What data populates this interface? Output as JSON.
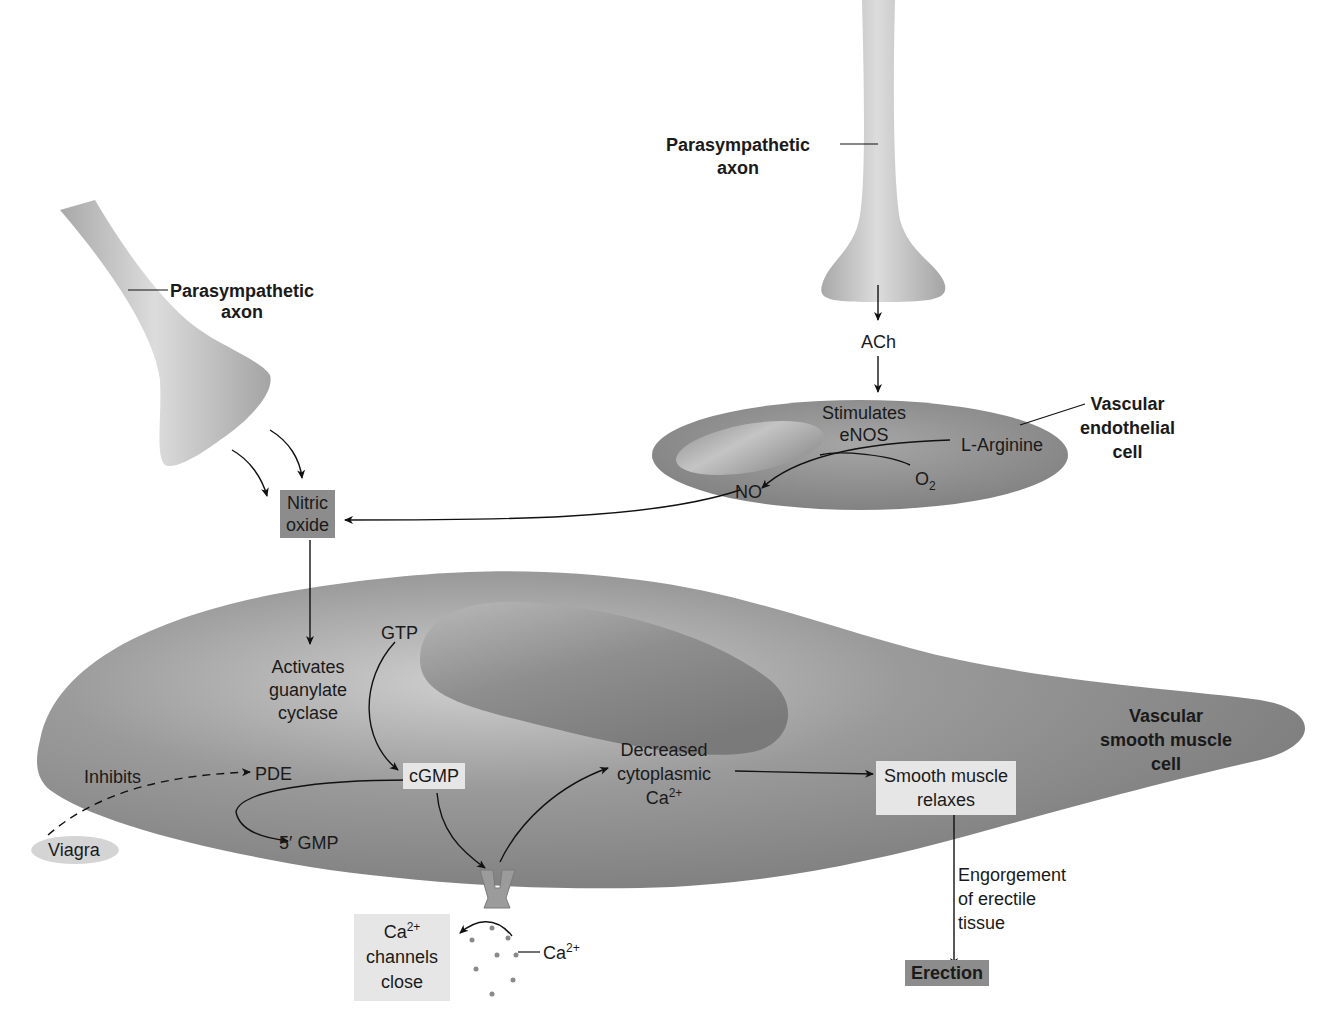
{
  "diagram": {
    "structures": {
      "axon_left": "Parasympathetic axon",
      "axon_right": "Parasympathetic axon",
      "endothelial_cell": [
        "Vascular",
        "endothelial",
        "cell"
      ],
      "smooth_muscle_cell": [
        "Vascular",
        "smooth muscle",
        "cell"
      ]
    },
    "labels": {
      "axon_left_1": "Parasympathetic",
      "axon_left_2": "axon",
      "axon_right_1": "Parasympathetic",
      "axon_right_2": "axon",
      "ach": "ACh",
      "stimulates": "Stimulates",
      "enos": "eNOS",
      "l_arginine": "L-Arginine",
      "o2_base": "O",
      "o2_sub": "2",
      "no": "NO",
      "endo_1": "Vascular",
      "endo_2": "endothelial",
      "endo_3": "cell",
      "nitric_1": "Nitric",
      "nitric_2": "oxide",
      "activates_1": "Activates",
      "activates_2": "guanylate",
      "activates_3": "cyclase",
      "gtp": "GTP",
      "cgmp": "cGMP",
      "pde": "PDE",
      "inhibits": "Inhibits",
      "viagra": "Viagra",
      "gmp5": "5′ GMP",
      "decreased_1": "Decreased",
      "decreased_2": "cytoplasmic",
      "decreased_3_base": "Ca",
      "decreased_3_sup": "2+",
      "relaxes_1": "Smooth muscle",
      "relaxes_2": "relaxes",
      "vsm_1": "Vascular",
      "vsm_2": "smooth muscle",
      "vsm_3": "cell",
      "channels_1_base": "Ca",
      "channels_1_sup": "2+",
      "channels_2": "channels",
      "channels_3": "close",
      "ca_ion_base": "Ca",
      "ca_ion_sup": "2+",
      "engorgement_1": "Engorgement",
      "engorgement_2": "of erectile",
      "engorgement_3": "tissue",
      "erection": "Erection"
    },
    "edges": [
      {
        "from": "Parasympathetic axon (left)",
        "to": "Nitric oxide",
        "style": "solid"
      },
      {
        "from": "Parasympathetic axon (right)",
        "to": "ACh",
        "style": "solid"
      },
      {
        "from": "ACh",
        "to": "Vascular endothelial cell",
        "style": "solid"
      },
      {
        "from": "L-Arginine + O2",
        "to": "NO",
        "via": "eNOS",
        "style": "solid"
      },
      {
        "from": "NO",
        "to": "Nitric oxide",
        "style": "solid"
      },
      {
        "from": "Nitric oxide",
        "to": "Activates guanylate cyclase",
        "style": "solid"
      },
      {
        "from": "GTP",
        "to": "cGMP",
        "style": "solid"
      },
      {
        "from": "cGMP",
        "to": "5' GMP",
        "via": "PDE",
        "style": "solid"
      },
      {
        "from": "Viagra",
        "to": "PDE",
        "label": "Inhibits",
        "style": "dashed"
      },
      {
        "from": "cGMP",
        "to": "Ca2+ channel",
        "style": "solid"
      },
      {
        "from": "Ca2+ channel",
        "to": "Decreased cytoplasmic Ca2+",
        "style": "solid"
      },
      {
        "from": "Ca2+ channel",
        "to": "Ca2+ channels close",
        "style": "solid"
      },
      {
        "from": "Decreased cytoplasmic Ca2+",
        "to": "Smooth muscle relaxes",
        "style": "solid"
      },
      {
        "from": "Smooth muscle relaxes",
        "to": "Erection",
        "label": "Engorgement of erectile tissue",
        "style": "solid"
      }
    ],
    "colors": {
      "cell_fill": "#8a8a8a",
      "cell_light": "#c8c8c8",
      "axon_fill": "#bdbdbd",
      "dark_box": "#8c8c8c",
      "light_box": "#e6e6e6",
      "viagra_fill": "#d4d4d4"
    }
  }
}
